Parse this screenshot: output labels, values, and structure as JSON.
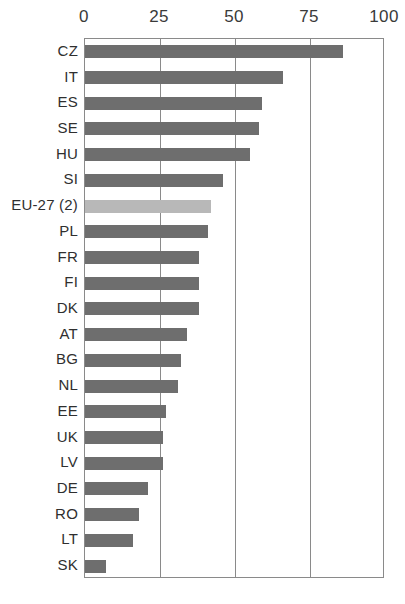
{
  "chart_data": {
    "type": "bar",
    "orientation": "horizontal",
    "title": "",
    "subtitle": "",
    "xlabel": "",
    "ylabel": "",
    "xlim": [
      0,
      100
    ],
    "ylim": null,
    "grid": true,
    "legend": null,
    "legend_position": "none",
    "xticks": [
      0,
      25,
      50,
      75,
      100
    ],
    "xtick_labels": [
      "0",
      "25",
      "50",
      "75",
      "100"
    ],
    "categories": [
      "CZ",
      "IT",
      "ES",
      "SE",
      "HU",
      "SI",
      "EU-27 (2)",
      "PL",
      "FR",
      "FI",
      "DK",
      "AT",
      "BG",
      "NL",
      "EE",
      "UK",
      "LV",
      "DE",
      "RO",
      "LT",
      "SK"
    ],
    "values": [
      86,
      66,
      59,
      58,
      55,
      46,
      42,
      41,
      38,
      38,
      38,
      34,
      32,
      31,
      27,
      26,
      26,
      21,
      18,
      16,
      7
    ],
    "highlight_category": "EU-27 (2)",
    "colors": {
      "bar": "#6e6e6e",
      "bar_highlight": "#b8b8b8",
      "frame": "#8a8a8a",
      "grid": "#8a8a8a",
      "text": "#2f2f2f",
      "background": "#ffffff"
    }
  }
}
